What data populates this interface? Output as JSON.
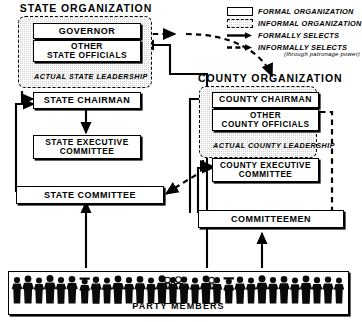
{
  "state_org": {
    "title": "STATE ORGANIZATION",
    "governor": "GOVERNOR",
    "other_officials_line1": "OTHER",
    "other_officials_line2": "STATE OFFICIALS",
    "leadership_label": "ACTUAL STATE LEADERSHIP",
    "chairman": "STATE CHAIRMAN",
    "exec_line1": "STATE EXECUTIVE",
    "exec_line2": "COMMITTEE",
    "committee": "STATE COMMITTEE"
  },
  "county_org": {
    "title": "COUNTY ORGANIZATION",
    "chairman": "COUNTY CHAIRMAN",
    "other_officials_line1": "OTHER",
    "other_officials_line2": "COUNTY OFFICIALS",
    "leadership_label": "ACTUAL COUNTY LEADERSHIP",
    "exec_line1": "COUNTY EXECUTIVE",
    "exec_line2": "COMMITTEE",
    "committeemen": "COMMITTEEMEN"
  },
  "party_members": {
    "label": "PARTY MEMBERS"
  },
  "legend": {
    "formal_organization": "FORMAL ORGANIZATION",
    "informal_organization": "INFORMAL ORGANIZATION",
    "formally_selects": "FORMALLY  SELECTS",
    "informally_selects": "INFORMALLY  SELECTS",
    "informally_selects_note": "(through patronage power)"
  },
  "colors": {
    "ink": "#000000",
    "paper": "#ffffff",
    "informal_fill": "#d2d2d2"
  }
}
